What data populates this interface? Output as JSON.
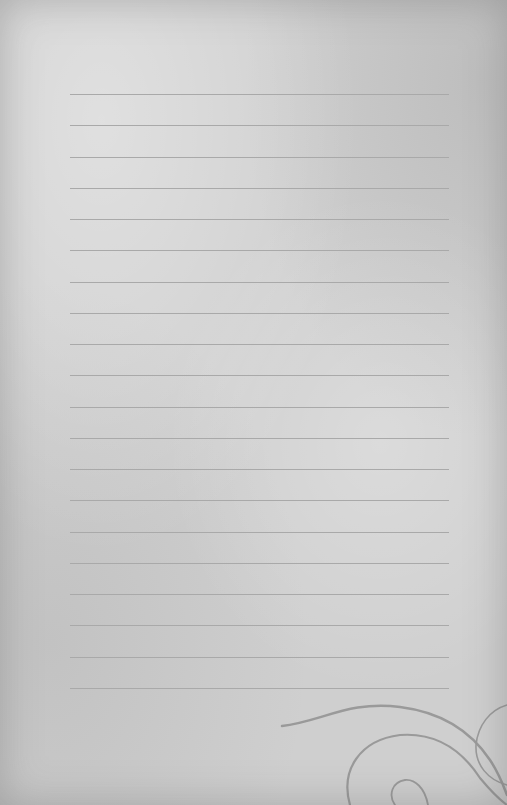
{
  "page": {
    "background_color": "#cfcfcf",
    "line_color": "#a9a9a9",
    "ornament_color": "#9a9a9a"
  },
  "lines": {
    "count": 20,
    "start_y": 94,
    "spacing": 31.26,
    "left": 70,
    "width": 379
  }
}
